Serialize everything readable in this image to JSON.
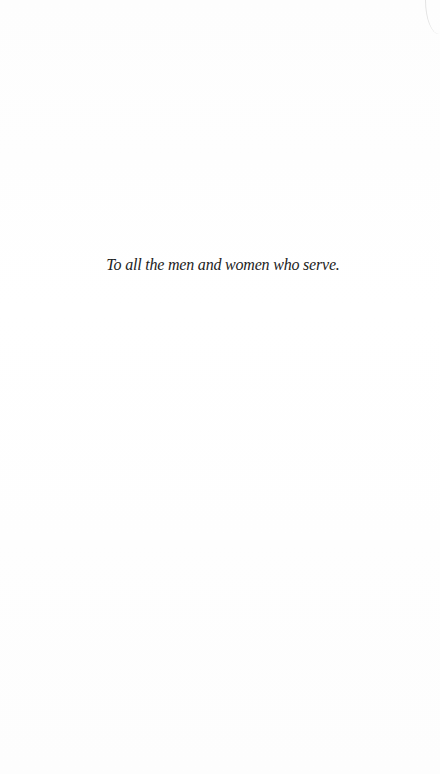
{
  "page": {
    "dedication": "To all the men and women who serve."
  },
  "colors": {
    "background": "#ffffff",
    "text": "#222222"
  }
}
